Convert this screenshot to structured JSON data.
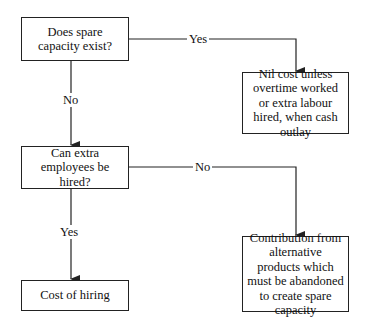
{
  "nodes": {
    "q1": {
      "text": "Does spare capacity exist?"
    },
    "r1": {
      "text": "Nil cost unless overtime worked or extra labour hired, when cash outlay"
    },
    "q2": {
      "text": "Can extra employees be hired?"
    },
    "r2": {
      "text": "Contribution from alternative products which must be abandoned to create spare capacity"
    },
    "r3": {
      "text": "Cost of hiring"
    }
  },
  "edges": [
    {
      "from": "q1",
      "to": "r1",
      "label": "Yes"
    },
    {
      "from": "q1",
      "to": "q2",
      "label": "No"
    },
    {
      "from": "q2",
      "to": "r2",
      "label": "No"
    },
    {
      "from": "q2",
      "to": "r3",
      "label": "Yes"
    }
  ],
  "colors": {
    "line": "#222222",
    "background": "#ffffff"
  }
}
